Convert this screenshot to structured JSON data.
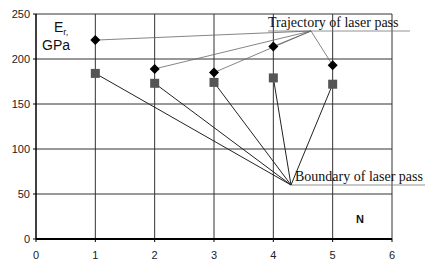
{
  "chart_data": {
    "type": "scatter",
    "title": "",
    "xlabel": "N",
    "ylabel": "Er, GPa",
    "ylabel_main": "E",
    "ylabel_sub": "r,",
    "ylabel_unit": "GPa",
    "xlim": [
      0,
      6
    ],
    "ylim": [
      0,
      250
    ],
    "xticks": [
      0,
      1,
      2,
      3,
      4,
      5,
      6
    ],
    "yticks": [
      0,
      50,
      100,
      150,
      200,
      250
    ],
    "grid": true,
    "legend": null,
    "x": [
      1,
      2,
      3,
      4,
      5
    ],
    "series": [
      {
        "name": "Trajectory of laser pass",
        "marker": "diamond",
        "color": "#000000",
        "values": [
          221,
          189,
          185,
          214,
          193
        ]
      },
      {
        "name": "Boundary of laser pass",
        "marker": "square",
        "color": "#555555",
        "values": [
          184,
          173,
          174,
          179,
          172
        ]
      }
    ],
    "annotations": [
      {
        "text": "Trajectory of laser pass",
        "points_to_series": "Trajectory of laser pass"
      },
      {
        "text": "Boundary of laser pass",
        "points_to_series": "Boundary of laser pass"
      }
    ]
  }
}
